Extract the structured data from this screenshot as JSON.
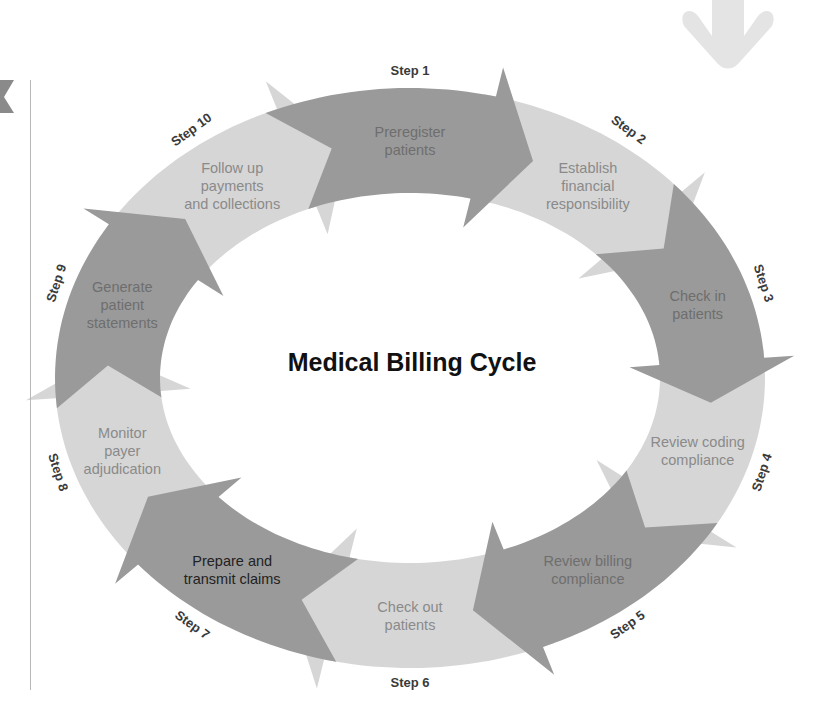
{
  "diagram": {
    "title": "Medical Billing Cycle",
    "colors": {
      "dark": "#9a9a9a",
      "light": "#d6d6d6",
      "text_dark_seg": "#6e6e6e",
      "text_light_seg": "#8a8a8a",
      "step_text": "#3a3a3a",
      "title_text": "#111111",
      "faint_arrow": "#e4e4e4",
      "rule": "#b8b8b8"
    },
    "steps": [
      {
        "step": "Step 1",
        "label_lines": [
          "Preregister",
          "patients"
        ],
        "shade": "dark"
      },
      {
        "step": "Step 2",
        "label_lines": [
          "Establish",
          "financial",
          "responsibility"
        ],
        "shade": "light"
      },
      {
        "step": "Step 3",
        "label_lines": [
          "Check in",
          "patients"
        ],
        "shade": "dark"
      },
      {
        "step": "Step 4",
        "label_lines": [
          "Review coding",
          "compliance"
        ],
        "shade": "light"
      },
      {
        "step": "Step 5",
        "label_lines": [
          "Review billing",
          "compliance"
        ],
        "shade": "dark"
      },
      {
        "step": "Step 6",
        "label_lines": [
          "Check out",
          "patients"
        ],
        "shade": "light"
      },
      {
        "step": "Step 7",
        "label_lines": [
          "Prepare and",
          "transmit claims"
        ],
        "shade": "dark"
      },
      {
        "step": "Step 8",
        "label_lines": [
          "Monitor",
          "payer",
          "adjudication"
        ],
        "shade": "light"
      },
      {
        "step": "Step 9",
        "label_lines": [
          "Generate",
          "patient",
          "statements"
        ],
        "shade": "dark"
      },
      {
        "step": "Step 10",
        "label_lines": [
          "Follow up",
          "payments",
          "and collections"
        ],
        "shade": "light"
      }
    ]
  }
}
